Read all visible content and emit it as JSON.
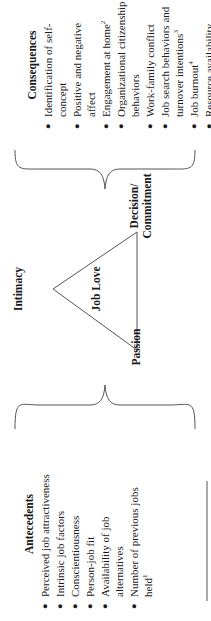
{
  "antecedents": {
    "title": "Antecedents",
    "items": [
      {
        "text": "Perceived job attractiveness",
        "sup": ""
      },
      {
        "text": "Intrinsic job factors",
        "sup": ""
      },
      {
        "text": "Conscientiousness",
        "sup": ""
      },
      {
        "text": "Person-job fit",
        "sup": ""
      },
      {
        "text": "Availability of job alternatives",
        "sup": ""
      },
      {
        "text": "Number of previous jobs held",
        "sup": "1"
      }
    ]
  },
  "triangle": {
    "center_label": "Job Love",
    "apex_label": "Intimacy",
    "left_label": "Passion",
    "right_label": "Decision/ Commitment"
  },
  "consequences": {
    "title": "Consequences",
    "items": [
      {
        "text": "Identification of self-concept",
        "sup": ""
      },
      {
        "text": "Positive and negative affect",
        "sup": ""
      },
      {
        "text": "Engagement at home",
        "sup": "2"
      },
      {
        "text": "Organizational citizenship behaviors",
        "sup": ""
      },
      {
        "text": "Work-family conflict",
        "sup": ""
      },
      {
        "text": "Job search behaviors and turnover intentions",
        "sup": "3"
      },
      {
        "text": "Job burnout",
        "sup": "4"
      },
      {
        "text": "Resource availability",
        "sup": ""
      }
    ]
  },
  "colors": {
    "line": "#555555",
    "text": "#1a1a1a"
  }
}
